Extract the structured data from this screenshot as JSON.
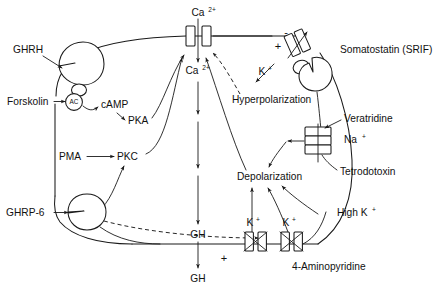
{
  "figure": {
    "type": "biological-signaling-diagram",
    "background_color": "#ffffff",
    "line_color": "#1a1a1a"
  },
  "labels": {
    "ghrh": "GHRH",
    "forskolin": "Forskolin",
    "ac": "AC",
    "camp": "cAMP",
    "pka": "PKA",
    "pma": "PMA",
    "pkc": "PKC",
    "ghrp6": "GHRP-6",
    "calcium_out": "Ca2+",
    "calcium_in": "Ca2+",
    "hyperpolarization": "Hyperpolarization",
    "potassium_srif": "K+",
    "somatostatin": "Somatostatin (SRIF)",
    "veratridine": "Veratridine",
    "sodium": "Na+",
    "tetrodotoxin": "Tetrodotoxin",
    "depolarization": "Depolarization",
    "high_potassium": "High K+",
    "potassium_left": "K+",
    "potassium_right": "K+",
    "aminopyridine": "4-Aminopyridine",
    "gh_inside": "GH",
    "gh_outside": "GH",
    "plus_sign_membrane": "+",
    "minus_sign_membrane": "-",
    "plus_sign_gh": "+"
  },
  "superscripts": {
    "calcium": "2+",
    "potassium": "+",
    "sodium": "+"
  },
  "base_symbols": {
    "calcium": "Ca",
    "potassium": "K",
    "sodium": "Na",
    "high_potassium_base": "High K"
  },
  "channels": [
    {
      "name": "calcium-channel",
      "ion": "Ca2+",
      "blocked": false,
      "orientation": "vertical-pair"
    },
    {
      "name": "potassium-channel-srif",
      "ion": "K+",
      "blocked": false,
      "orientation": "tilted"
    },
    {
      "name": "sodium-channel",
      "ion": "Na+",
      "blocked": false,
      "orientation": "horizontal-stack"
    },
    {
      "name": "potassium-channel-left",
      "ion": "K+",
      "blocked": true,
      "orientation": "vertical-pair"
    },
    {
      "name": "potassium-channel-right",
      "ion": "K+",
      "blocked": true,
      "orientation": "vertical-pair"
    }
  ],
  "receptors": [
    {
      "name": "ghrh-receptor",
      "ligand": "GHRH"
    },
    {
      "name": "somatostatin-receptor",
      "ligand": "Somatostatin (SRIF)"
    },
    {
      "name": "ghrp6-receptor",
      "ligand": "GHRP-6"
    }
  ],
  "drugs": [
    "Forskolin",
    "PMA",
    "Veratridine",
    "Tetrodotoxin",
    "4-Aminopyridine",
    "GHRP-6"
  ]
}
